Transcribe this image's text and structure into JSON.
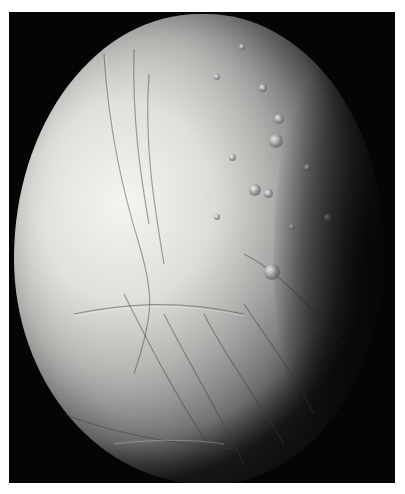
{
  "image": {
    "subject": "Icy moon surface (grayscale)",
    "description": "Large grayscale moon, illuminated from the left, showing cratered terrain at upper right and long fractures/ridges across the lower portion, set on a black background inside a white-bordered frame",
    "colors": {
      "background": "#ffffff",
      "space": "#050505",
      "surface_light": "#e6e6e3",
      "surface_mid": "#b8b8b5",
      "surface_shadow": "#3a3a3a"
    }
  }
}
